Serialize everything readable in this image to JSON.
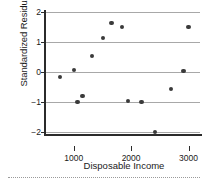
{
  "chart_data": {
    "type": "scatter",
    "title": "",
    "xlabel": "Disposable Income",
    "ylabel": "Standardized Residuals",
    "xlim": [
      500,
      3200
    ],
    "ylim": [
      -2,
      2
    ],
    "xticks": [
      1000,
      2000,
      3000
    ],
    "xtick_labels": [
      "1000",
      "2000",
      "3000"
    ],
    "yticks": [
      2,
      1,
      0,
      -1,
      -2
    ],
    "ytick_labels": [
      "2",
      "1",
      "0",
      "−1",
      "−2"
    ],
    "grid": true,
    "legend": false,
    "points": [
      {
        "x": 765,
        "y": -0.17
      },
      {
        "x": 1000,
        "y": 0.07
      },
      {
        "x": 1065,
        "y": -1.0
      },
      {
        "x": 1150,
        "y": -0.8
      },
      {
        "x": 1320,
        "y": 0.53
      },
      {
        "x": 1510,
        "y": 1.13
      },
      {
        "x": 1660,
        "y": 1.63
      },
      {
        "x": 1840,
        "y": 1.5
      },
      {
        "x": 1945,
        "y": -0.97
      },
      {
        "x": 2180,
        "y": -1.0
      },
      {
        "x": 2420,
        "y": -2.0
      },
      {
        "x": 2700,
        "y": -0.57
      },
      {
        "x": 2915,
        "y": 0.03
      },
      {
        "x": 3000,
        "y": 1.5
      }
    ],
    "marker_color": "#3a3a3a",
    "grid_color": "#a8a8a8",
    "axis_color": "#2b2b2b"
  }
}
